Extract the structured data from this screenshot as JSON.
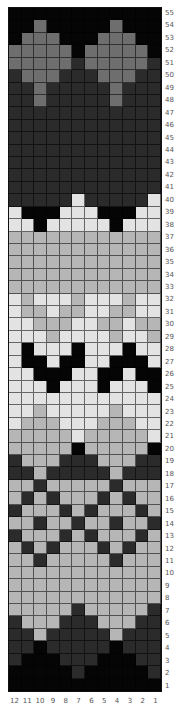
{
  "chart_data": {
    "type": "heatmap",
    "title": "",
    "columns": [
      "12",
      "11",
      "10",
      "9",
      "8",
      "7",
      "6",
      "5",
      "4",
      "3",
      "2",
      "1"
    ],
    "rows_top_to_bottom": [
      "55",
      "54",
      "53",
      "52",
      "51",
      "50",
      "49",
      "48",
      "47",
      "46",
      "45",
      "44",
      "43",
      "42",
      "41",
      "40",
      "39",
      "38",
      "37",
      "36",
      "35",
      "34",
      "33",
      "32",
      "31",
      "30",
      "29",
      "28",
      "27",
      "26",
      "25",
      "24",
      "23",
      "22",
      "21",
      "20",
      "19",
      "18",
      "17",
      "16",
      "15",
      "14",
      "13",
      "12",
      "11",
      "10",
      "9",
      "8",
      "7",
      "6",
      "5",
      "4",
      "3",
      "2",
      "1"
    ],
    "palette": {
      "B": "#050505",
      "D": "#2b2b2b",
      "M": "#6e6e6e",
      "L": "#b6b6b6",
      "V": "#e3e3e3"
    },
    "legend": {
      "B": "black",
      "D": "dark gray",
      "M": "medium gray",
      "L": "light gray",
      "V": "very light gray"
    },
    "grid": [
      "BBBBBBBBBBBB",
      "BBMBBBBBMBBB",
      "BMMMBBBMMMBB",
      "MMMMMBMMMMMB",
      "MMMMMDMMMMMD",
      "DMMMDDDMMMDD",
      "DDMDDDDDMDDD",
      "DDMDDDDDMDDD",
      "DDDDDDDDDDDD",
      "DDDDDDDDDDDD",
      "DDDDDDDDDDDD",
      "DDDDDDDDDDDD",
      "DDDDDDDDDDDD",
      "DDDDDDDDDDDD",
      "DDDDDDDDDDDD",
      "DDDDDVDDDDDV",
      "VBBBVVVBBBVV",
      "VVBVVVVVBVVV",
      "LLLLLLLLLLLL",
      "LLLLLLLLLLLL",
      "LLLLLLLLLLLL",
      "LLLLLLLLLLLL",
      "LLLLLLLLLLLL",
      "VLVVVLVVVLVV",
      "VLLVLLVVLLVV",
      "VVLLLVVLLVLL",
      "VVVLVVVVLVVL",
      "VBVVVBVVVBVV",
      "VBBVBBVVBBBV",
      "VVBBBVVBBVBB",
      "VVVBVVVBVVVB",
      "VVVVVVVVVVVV",
      "VVLVVVVVLVVV",
      "VLLLVVVLLLVV",
      "LLLLLVLLLLLV",
      "LLLLLBLLLLLB",
      "DLLLDDDLLLDD",
      "DDLDDDDDLDDD",
      "LLDLLLLLDLLL",
      "LDLDLLLDLDLL",
      "DLLLDLDLLLDL",
      "LLDLLDLLDLLD",
      "DLLLDLDLLLDL",
      "LDLDLLLDLDLL",
      "LLDLLLLLDLLL",
      "LLLLLLLLLLLL",
      "LLLLLLLLLLLL",
      "LLLLLLLLLLLL",
      "LLLLLDLLLLLD",
      "DLLLDDDLLLDD",
      "DDLDDDDDLDDD",
      "DDBDDDDDBDDD",
      "DBBBDDDBBBDD",
      "BBBBBDBBBBBD",
      "BBBBBBBBBBBB"
    ]
  }
}
